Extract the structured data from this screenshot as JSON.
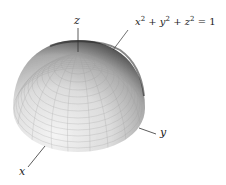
{
  "diagram": {
    "type": "3d-surface",
    "shape": "upper hemisphere",
    "equation": {
      "text": "x^2 + y^2 + z^2 = 1",
      "parts": [
        "x",
        "2",
        " + ",
        "y",
        "2",
        " + ",
        "z",
        "2",
        " = 1"
      ]
    },
    "axes": {
      "x": {
        "label": "x"
      },
      "y": {
        "label": "y"
      },
      "z": {
        "label": "z"
      }
    },
    "colors": {
      "surface_light": "#e8e8e8",
      "surface_mid": "#bdbdbd",
      "surface_dark": "#3a3a3a",
      "axis": "#333333"
    }
  }
}
